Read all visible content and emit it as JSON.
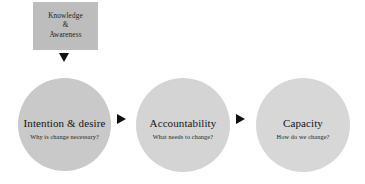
{
  "diagram": {
    "type": "flow-diagram",
    "background_color": "#ffffff",
    "source_box": {
      "name": "Knowledge & Awareness",
      "fill_color": "#bdbdbd",
      "lines": [
        "Knowledge",
        "&",
        "Awareness"
      ]
    },
    "connectors": [
      {
        "id": "arrow-down-1",
        "direction": "down",
        "color": "#101010",
        "from": "Knowledge & Awareness",
        "to": "Intention & desire"
      },
      {
        "id": "arrow-right-1",
        "direction": "right",
        "color": "#101010",
        "from": "Intention & desire",
        "to": "Accountability"
      },
      {
        "id": "arrow-right-2",
        "direction": "right",
        "color": "#101010",
        "from": "Accountability",
        "to": "Capacity"
      }
    ],
    "stages": [
      {
        "id": "intention",
        "title": "Intention & desire",
        "question": "Why is change necessary?",
        "fill_color": "#c9c9c9"
      },
      {
        "id": "accountability",
        "title": "Accountability",
        "question": "What needs to change?",
        "fill_color": "#d4d4d4"
      },
      {
        "id": "capacity",
        "title": "Capacity",
        "question": "How do we change?",
        "fill_color": "#d7d7d7"
      }
    ]
  }
}
